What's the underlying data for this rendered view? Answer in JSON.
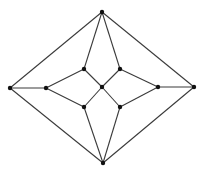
{
  "diagram": {
    "type": "undirected-graph",
    "node_color": "#111111",
    "edge_color": "#3a3a3a",
    "nodes": [
      {
        "id": "top",
        "x": 102,
        "y": 12
      },
      {
        "id": "left",
        "x": 10,
        "y": 88
      },
      {
        "id": "right",
        "x": 194,
        "y": 87
      },
      {
        "id": "bottom",
        "x": 103,
        "y": 163
      },
      {
        "id": "inner-left",
        "x": 46,
        "y": 88
      },
      {
        "id": "inner-right",
        "x": 158,
        "y": 87
      },
      {
        "id": "upper-left",
        "x": 84,
        "y": 69
      },
      {
        "id": "upper-right",
        "x": 120,
        "y": 69
      },
      {
        "id": "center",
        "x": 102,
        "y": 87
      },
      {
        "id": "lower-left",
        "x": 84,
        "y": 107
      },
      {
        "id": "lower-right",
        "x": 120,
        "y": 107
      }
    ],
    "edges": [
      [
        "top",
        "left"
      ],
      [
        "top",
        "right"
      ],
      [
        "bottom",
        "left"
      ],
      [
        "bottom",
        "right"
      ],
      [
        "left",
        "inner-left"
      ],
      [
        "right",
        "inner-right"
      ],
      [
        "top",
        "upper-left"
      ],
      [
        "top",
        "upper-right"
      ],
      [
        "bottom",
        "lower-left"
      ],
      [
        "bottom",
        "lower-right"
      ],
      [
        "inner-left",
        "upper-left"
      ],
      [
        "inner-left",
        "lower-left"
      ],
      [
        "inner-right",
        "upper-right"
      ],
      [
        "inner-right",
        "lower-right"
      ],
      [
        "center",
        "upper-left"
      ],
      [
        "center",
        "upper-right"
      ],
      [
        "center",
        "lower-left"
      ],
      [
        "center",
        "lower-right"
      ]
    ]
  }
}
